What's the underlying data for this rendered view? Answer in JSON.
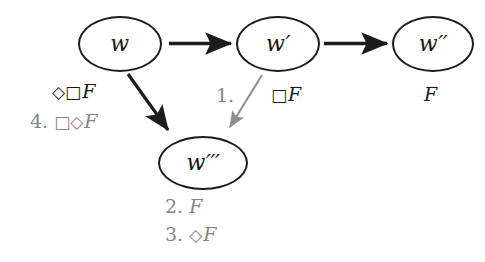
{
  "diagram": {
    "colors": {
      "ink": "#1a1a1a",
      "gray": "#858585",
      "background": "#ffffff"
    },
    "nodes": [
      {
        "id": "w",
        "label": "w",
        "primes": "",
        "cx": 120,
        "cy": 44,
        "rx": 42,
        "ry": 28
      },
      {
        "id": "wp",
        "label": "w",
        "primes": "′",
        "cx": 278,
        "cy": 44,
        "rx": 42,
        "ry": 28
      },
      {
        "id": "wpp",
        "label": "w",
        "primes": "′′",
        "cx": 433,
        "cy": 44,
        "rx": 41,
        "ry": 28
      },
      {
        "id": "wppp",
        "label": "w",
        "primes": "′′′",
        "cx": 203,
        "cy": 163,
        "rx": 45,
        "ry": 27
      }
    ],
    "edges": [
      {
        "id": "w-to-wp",
        "from": "w",
        "to": "wp",
        "style": "solid-black"
      },
      {
        "id": "wp-to-wpp",
        "from": "wp",
        "to": "wpp",
        "style": "solid-black"
      },
      {
        "id": "w-to-wppp",
        "from": "w",
        "to": "wppp",
        "style": "solid-black"
      },
      {
        "id": "wp-to-wppp",
        "from": "wp",
        "to": "wppp",
        "style": "solid-gray"
      }
    ],
    "annotations": [
      {
        "id": "ann-w-diamond-box-f",
        "step": "",
        "operators": "◇□",
        "formula": "F",
        "color": "black",
        "x": 52,
        "y": 82
      },
      {
        "id": "ann-w-step4",
        "step": "4.",
        "operators": "□◇",
        "formula": "F",
        "color": "gray",
        "x": 30,
        "y": 112
      },
      {
        "id": "ann-step1",
        "step": "1.",
        "operators": "",
        "formula": "",
        "color": "gray",
        "x": 216,
        "y": 86
      },
      {
        "id": "ann-wp-box-f",
        "step": "",
        "operators": "□",
        "formula": "F",
        "color": "black",
        "x": 271,
        "y": 85
      },
      {
        "id": "ann-wpp-f",
        "step": "",
        "operators": "",
        "formula": "F",
        "color": "black",
        "x": 424,
        "y": 85
      },
      {
        "id": "ann-wppp-step2",
        "step": "2.",
        "operators": "",
        "formula": "F",
        "color": "gray",
        "x": 165,
        "y": 197
      },
      {
        "id": "ann-wppp-step3",
        "step": "3.",
        "operators": "◇",
        "formula": "F",
        "color": "gray",
        "x": 165,
        "y": 225
      }
    ]
  }
}
